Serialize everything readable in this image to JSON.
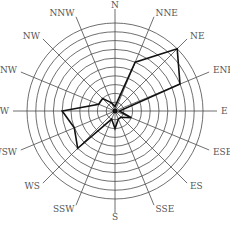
{
  "chart_data": {
    "type": "radar",
    "subtype": "wind-rose",
    "title": "",
    "directions": [
      "N",
      "NNE",
      "NE",
      "ENE",
      "E",
      "ESE",
      "ES",
      "SSE",
      "S",
      "SSW",
      "WS",
      "WSW",
      "W",
      "WNW",
      "NW",
      "NNW"
    ],
    "values": [
      0.5,
      6,
      10,
      8,
      0.5,
      2,
      1,
      1,
      2,
      1,
      6,
      5,
      6,
      2,
      2,
      1
    ],
    "rings": 10,
    "rlim": [
      0,
      10
    ],
    "grid": true,
    "legend": null,
    "colors": {
      "grid": "#4a4a4a",
      "series": "#111111",
      "label": "#555555"
    }
  }
}
